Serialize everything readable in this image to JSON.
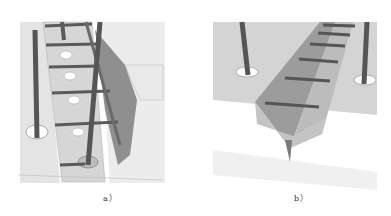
{
  "figure": {
    "panels": [
      {
        "id": "a",
        "caption": "a）",
        "description": "Vertical trench with ladder rungs, holes and poles"
      },
      {
        "id": "b",
        "caption": "b）",
        "description": "V-shaped trench with ladder rungs and poles"
      }
    ],
    "colors": {
      "surface": "#d8d8d8",
      "surface_light": "#e6e6e6",
      "trench_dark": "#8a8a8a",
      "bar": "#5a5a5a",
      "hole": "#ffffff"
    }
  }
}
